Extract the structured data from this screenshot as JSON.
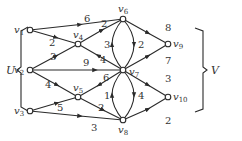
{
  "diagram": {
    "type": "directed-weighted-network",
    "sets": [
      {
        "id": "U",
        "label": "U",
        "members": [
          "v1",
          "v2",
          "v3"
        ],
        "side": "left"
      },
      {
        "id": "V",
        "label": "V",
        "members": [
          "v9",
          "v10"
        ],
        "side": "right"
      }
    ],
    "nodes": [
      {
        "id": "v1",
        "label": "v",
        "sub": "1",
        "x": 30,
        "y": 30
      },
      {
        "id": "v2",
        "label": "v",
        "sub": "2",
        "x": 30,
        "y": 70
      },
      {
        "id": "v3",
        "label": "v",
        "sub": "3",
        "x": 30,
        "y": 111
      },
      {
        "id": "v4",
        "label": "v",
        "sub": "4",
        "x": 78,
        "y": 44
      },
      {
        "id": "v5",
        "label": "v",
        "sub": "5",
        "x": 78,
        "y": 97
      },
      {
        "id": "v6",
        "label": "v",
        "sub": "6",
        "x": 123,
        "y": 19
      },
      {
        "id": "v7",
        "label": "v",
        "sub": "7",
        "x": 123,
        "y": 70
      },
      {
        "id": "v8",
        "label": "v",
        "sub": "8",
        "x": 123,
        "y": 120
      },
      {
        "id": "v9",
        "label": "v",
        "sub": "9",
        "x": 168,
        "y": 44
      },
      {
        "id": "v10",
        "label": "v",
        "sub": "10",
        "x": 168,
        "y": 97
      }
    ],
    "edges": [
      {
        "from": "v1",
        "to": "v6",
        "weight": "6"
      },
      {
        "from": "v1",
        "to": "v4",
        "weight": "2"
      },
      {
        "from": "v2",
        "to": "v4",
        "weight": "3"
      },
      {
        "from": "v4",
        "to": "v6",
        "weight": "2"
      },
      {
        "from": "v7",
        "to": "v4",
        "weight": "4"
      },
      {
        "from": "v2",
        "to": "v7",
        "weight": "9"
      },
      {
        "from": "v2",
        "to": "v5",
        "weight": "4"
      },
      {
        "from": "v3",
        "to": "v5",
        "weight": "5"
      },
      {
        "from": "v3",
        "to": "v8",
        "weight": "3"
      },
      {
        "from": "v7",
        "to": "v5",
        "weight": "6"
      },
      {
        "from": "v5",
        "to": "v8",
        "weight": "2"
      },
      {
        "from": "v7",
        "to": "v6",
        "weight": "3",
        "curve": "left"
      },
      {
        "from": "v6",
        "to": "v7",
        "weight": "2",
        "curve": "right"
      },
      {
        "from": "v8",
        "to": "v7",
        "weight": "1",
        "curve": "left"
      },
      {
        "from": "v7",
        "to": "v8",
        "weight": "4",
        "curve": "right"
      },
      {
        "from": "v6",
        "to": "v9",
        "weight": "8"
      },
      {
        "from": "v7",
        "to": "v9",
        "weight": "7"
      },
      {
        "from": "v7",
        "to": "v10",
        "weight": "3"
      },
      {
        "from": "v8",
        "to": "v10",
        "weight": "2"
      }
    ]
  },
  "labels": {
    "U": "U",
    "V": "V",
    "v": "v",
    "w": {
      "v1v6": "6",
      "v1v4": "2",
      "v2v4": "3",
      "v4v6": "2",
      "v7v4": "4",
      "v2v7": "9",
      "v2v5": "4",
      "v3v5": "5",
      "v3v8": "3",
      "v7v5": "6",
      "v5v8": "2",
      "v7v6": "3",
      "v6v7": "2",
      "v8v7": "1",
      "v7v8": "4",
      "v6v9": "8",
      "v7v9": "7",
      "v7v10": "3",
      "v8v10": "2"
    },
    "sub": {
      "v1": "1",
      "v2": "2",
      "v3": "3",
      "v4": "4",
      "v5": "5",
      "v6": "6",
      "v7": "7",
      "v8": "8",
      "v9": "9",
      "v10": "10"
    }
  }
}
